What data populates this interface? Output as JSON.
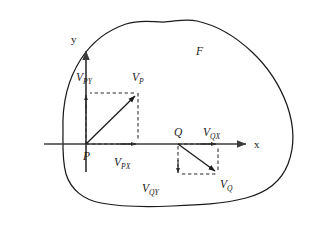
{
  "figure": {
    "name": "vector-field-region-diagram",
    "background_color": "#ffffff",
    "stroke_color": "#1a1a1a",
    "axis_color": "#3b3b3b",
    "region_label": "F",
    "axes": {
      "x_label": "x",
      "y_label": "y",
      "origin_label": "P"
    },
    "points": [
      {
        "id": "P",
        "label": "P"
      },
      {
        "id": "Q",
        "label": "Q"
      }
    ],
    "vectors": [
      {
        "id": "VP",
        "label_main": "V",
        "label_sub": "P",
        "label": "V_P",
        "component_x_main": "V",
        "component_x_sub": "PX",
        "component_x_label": "V_PX",
        "component_y_main": "V",
        "component_y_sub": "PY",
        "component_y_label": "V_PY",
        "direction": "up-right",
        "anchor": "P"
      },
      {
        "id": "VQ",
        "label_main": "V",
        "label_sub": "Q",
        "label": "V_Q",
        "component_x_main": "V",
        "component_x_sub": "QX",
        "component_x_label": "V_QX",
        "component_y_main": "V",
        "component_y_sub": "QY",
        "component_y_label": "V_QY",
        "direction": "down-right",
        "anchor": "Q"
      }
    ]
  },
  "labels": {
    "region": "F",
    "axis_x": "x",
    "axis_y": "y",
    "point_p": "P",
    "point_q": "Q",
    "vp_main": "V",
    "vp_sub": "P",
    "vpx_main": "V",
    "vpx_sub": "PX",
    "vpy_main": "V",
    "vpy_sub": "PY",
    "vq_main": "V",
    "vq_sub": "Q",
    "vqx_main": "V",
    "vqx_sub": "QX",
    "vqy_main": "V",
    "vqy_sub": "QY"
  },
  "geometry": {
    "region_path": "M 62 128 C 62 74 86 34 126 21 C 166 8 214 14 250 38 C 282 60 296 92 293 124 C 290 156 268 182 236 194 C 200 207 152 208 116 204 C 84 200 64 180 62 152 Z",
    "x_axis": {
      "x1": 44,
      "y1": 144,
      "x2": 248,
      "y2": 144
    },
    "y_axis": {
      "x1": 86,
      "y1": 172,
      "x2": 86,
      "y2": 48
    },
    "p_point": {
      "x": 86,
      "y": 144
    },
    "q_point": {
      "x": 178,
      "y": 144
    },
    "vp_tip": {
      "x": 138,
      "y": 93
    },
    "vq_tip": {
      "x": 218,
      "y": 174
    },
    "vpx_tip": {
      "x": 138,
      "y": 144
    },
    "vpy_tip": {
      "x": 86,
      "y": 93
    },
    "vqx_tip": {
      "x": 218,
      "y": 144
    },
    "vqy_tip": {
      "x": 178,
      "y": 174
    }
  }
}
